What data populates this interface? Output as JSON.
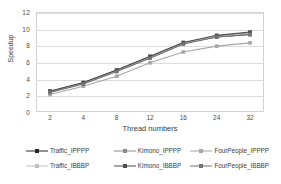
{
  "chart_data": {
    "type": "line",
    "title": "",
    "xlabel": "Thread numbers",
    "ylabel": "Speedup",
    "x": [
      2,
      4,
      8,
      12,
      16,
      24,
      32
    ],
    "xtick_labels": [
      "2",
      "4",
      "8",
      "12",
      "16",
      "24",
      "32"
    ],
    "ytick_labels": [
      "0",
      "2",
      "4",
      "6",
      "8",
      "10",
      "12"
    ],
    "yticks": [
      0,
      2,
      4,
      6,
      8,
      10,
      12
    ],
    "ylim": [
      0,
      12
    ],
    "grid": "horizontal",
    "legend_position": "bottom",
    "series": [
      {
        "name": "Traffic_IPPPP",
        "color": "#262626",
        "marker": "square",
        "values": [
          2.5,
          3.5,
          5.0,
          6.6,
          8.3,
          9.0,
          9.3
        ]
      },
      {
        "name": "Kimono_IPPPP",
        "color": "#8c8c8c",
        "marker": "square",
        "values": [
          2.4,
          3.4,
          4.9,
          6.5,
          8.2,
          9.1,
          9.5
        ]
      },
      {
        "name": "FourPeople_IPPPP",
        "color": "#a6a6a6",
        "marker": "square",
        "values": [
          2.1,
          3.1,
          4.3,
          5.9,
          7.2,
          7.9,
          8.3
        ]
      },
      {
        "name": "Traffic_IBBBP",
        "color": "#bfbfbf",
        "marker": "square",
        "values": [
          2.45,
          3.45,
          4.95,
          6.55,
          8.25,
          9.05,
          9.4
        ]
      },
      {
        "name": "Kimono_IBBBP",
        "color": "#4d4d4d",
        "marker": "square",
        "values": [
          2.5,
          3.55,
          5.05,
          6.7,
          8.35,
          9.2,
          9.6
        ]
      },
      {
        "name": "FourPeople_IBBBP",
        "color": "#737373",
        "marker": "square",
        "values": [
          2.35,
          3.35,
          4.85,
          6.45,
          8.15,
          9.0,
          9.3
        ]
      }
    ]
  },
  "legend": {
    "row1": [
      "Traffic_IPPPP",
      "Kimono_IPPPP",
      "FourPeople_IPPPP"
    ],
    "row2": [
      "Traffic_IBBBP",
      "Kimono_IBBBP",
      "FourPeople_IBBBP"
    ]
  },
  "colors": {
    "grid": "#dcdcdc",
    "frame": "#d2d2d2",
    "text": "#3b3b3b",
    "background": "#ffffff"
  }
}
